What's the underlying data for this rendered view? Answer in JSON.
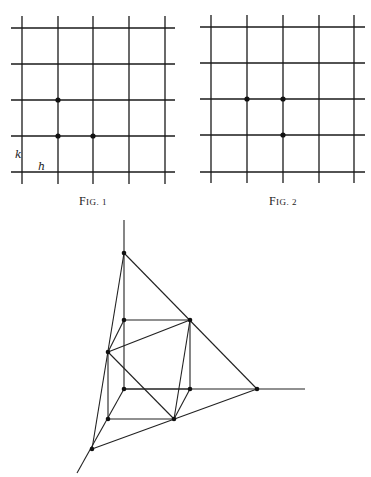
{
  "figures": [
    {
      "id": "fig1",
      "caption": "Fig. 1",
      "caption_pos": [
        93,
        205
      ],
      "grid": {
        "x_lines": [
          22,
          58,
          93,
          129,
          165
        ],
        "y_lines": [
          28,
          64,
          100,
          136,
          172
        ],
        "x_extent": [
          11,
          175
        ],
        "y_extent": [
          16,
          184
        ]
      },
      "points": [
        [
          58,
          100
        ],
        [
          58,
          136
        ],
        [
          93,
          136
        ]
      ],
      "labels": [
        {
          "text": "k",
          "x": 15,
          "y": 158
        },
        {
          "text": "h",
          "x": 38,
          "y": 170
        }
      ]
    },
    {
      "id": "fig2",
      "caption": "Fig. 2",
      "caption_pos": [
        283,
        205
      ],
      "grid": {
        "x_lines": [
          211,
          247,
          283,
          319,
          354
        ],
        "y_lines": [
          27,
          63,
          99,
          135,
          172
        ],
        "x_extent": [
          200,
          365
        ],
        "y_extent": [
          15,
          183
        ]
      },
      "points": [
        [
          247,
          99
        ],
        [
          283,
          99
        ],
        [
          283,
          135
        ]
      ],
      "labels": []
    },
    {
      "id": "fig3",
      "caption": "",
      "vertices": {
        "A": [
          124,
          253
        ],
        "B": [
          124,
          320
        ],
        "C": [
          190,
          320
        ],
        "D": [
          108,
          352
        ],
        "E": [
          124,
          389
        ],
        "F": [
          190,
          389
        ],
        "G": [
          257,
          389
        ],
        "H": [
          108,
          419
        ],
        "I": [
          174,
          419
        ],
        "J": [
          92,
          449
        ]
      },
      "axes": [
        [
          [
            124,
            220
          ],
          [
            124,
            389
          ]
        ],
        [
          [
            124,
            389
          ],
          [
            305,
            389
          ]
        ],
        [
          [
            124,
            389
          ],
          [
            77,
            473
          ]
        ]
      ],
      "edges": [
        [
          "A",
          "G"
        ],
        [
          "G",
          "J"
        ],
        [
          "J",
          "A"
        ],
        [
          "B",
          "C"
        ],
        [
          "C",
          "F"
        ],
        [
          "E",
          "F"
        ],
        [
          "D",
          "H"
        ],
        [
          "H",
          "I"
        ],
        [
          "B",
          "D"
        ],
        [
          "F",
          "I"
        ],
        [
          "D",
          "C"
        ],
        [
          "C",
          "I"
        ],
        [
          "I",
          "D"
        ]
      ],
      "points": [
        "A",
        "B",
        "C",
        "D",
        "E",
        "F",
        "G",
        "H",
        "I",
        "J"
      ]
    }
  ]
}
